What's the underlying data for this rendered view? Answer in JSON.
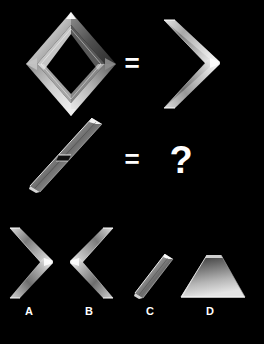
{
  "puzzle": {
    "title": "Visual analogy puzzle",
    "background_color": "#000000",
    "shape_material": "chrome-bevel",
    "shape_colors": {
      "highlight": "#ffffff",
      "light": "#d8d8d8",
      "mid": "#9a9a9a",
      "shadow": "#4a4a4a",
      "dark": "#141414"
    }
  },
  "rows": [
    {
      "name": "row-1",
      "left_shape": {
        "name": "diamond-outline",
        "label": "diamond"
      },
      "operator": "=",
      "right_shape": {
        "name": "right-chevron",
        "label": "right chevron"
      }
    },
    {
      "name": "row-2",
      "left_shape": {
        "name": "diagonal-bar-notched",
        "label": "diagonal bar"
      },
      "operator": "=",
      "right_shape": {
        "name": "unknown",
        "label": "?"
      }
    }
  ],
  "operators": {
    "row1_equals": "=",
    "row2_equals": "=",
    "question_mark": "?"
  },
  "options": [
    {
      "letter": "A",
      "shape": "right-chevron",
      "description": "right-pointing chevron"
    },
    {
      "letter": "B",
      "shape": "left-chevron",
      "description": "left-pointing chevron"
    },
    {
      "letter": "C",
      "shape": "short-diagonal-bar",
      "description": "short diagonal bar"
    },
    {
      "letter": "D",
      "shape": "filled-trapezoid",
      "description": "filled shaded trapezoid"
    }
  ]
}
